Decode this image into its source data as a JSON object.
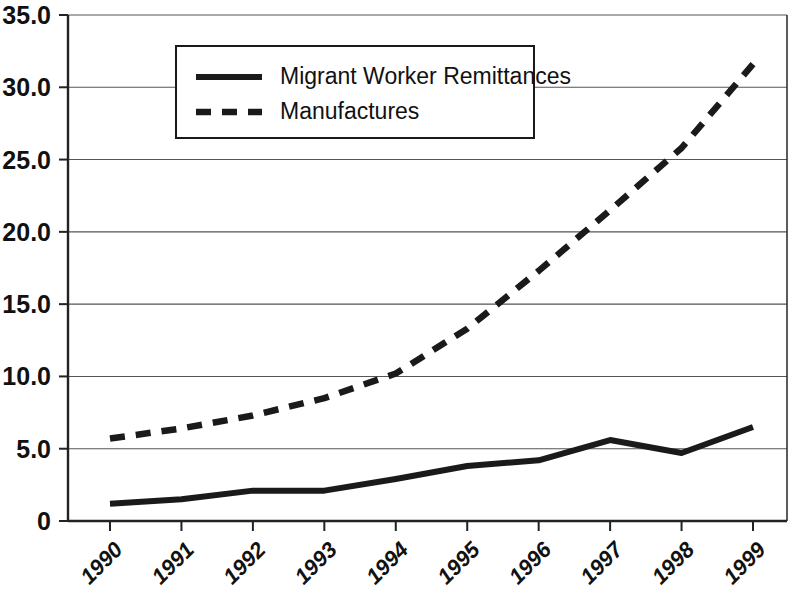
{
  "chart_data": {
    "type": "line",
    "title": "",
    "subtitle": "",
    "xlabel": "",
    "ylabel": "",
    "categories": [
      "1990",
      "1991",
      "1992",
      "1993",
      "1994",
      "1995",
      "1996",
      "1997",
      "1998",
      "1999"
    ],
    "series": [
      {
        "name": "Migrant Worker Remittances",
        "style": "solid",
        "values": [
          1.2,
          1.5,
          2.1,
          2.1,
          2.9,
          3.8,
          4.2,
          5.6,
          4.7,
          6.5
        ]
      },
      {
        "name": "Manufactures",
        "style": "dashed",
        "values": [
          5.7,
          6.4,
          7.3,
          8.5,
          10.2,
          13.3,
          17.3,
          21.5,
          25.8,
          31.6
        ]
      }
    ],
    "ylim": [
      0,
      35
    ],
    "yticks": [
      0,
      5,
      15,
      10,
      20,
      25,
      30,
      35
    ],
    "ytick_labels": [
      "0",
      "5.0",
      "10.0",
      "15.0",
      "20.0",
      "25.0",
      "30.0",
      "35.0"
    ],
    "grid": true,
    "legend_position": "top-left-inside",
    "axis_color": "#1a1a1a",
    "grid_color": "#555555",
    "series_color": "#1a1a1a",
    "background": "#ffffff"
  },
  "legend": {
    "entries": [
      {
        "label": "Migrant Worker Remittances",
        "style": "solid"
      },
      {
        "label": "Manufactures",
        "style": "dashed"
      }
    ]
  },
  "axes": {
    "y": {
      "ticks": [
        {
          "label": "35.0",
          "value": 35
        },
        {
          "label": "30.0",
          "value": 30
        },
        {
          "label": "25.0",
          "value": 25
        },
        {
          "label": "20.0",
          "value": 20
        },
        {
          "label": "15.0",
          "value": 15
        },
        {
          "label": "10.0",
          "value": 10
        },
        {
          "label": "5.0",
          "value": 5
        },
        {
          "label": "0",
          "value": 0
        }
      ]
    },
    "x": {
      "ticks": [
        "1990",
        "1991",
        "1992",
        "1993",
        "1994",
        "1995",
        "1996",
        "1997",
        "1998",
        "1999"
      ]
    }
  }
}
